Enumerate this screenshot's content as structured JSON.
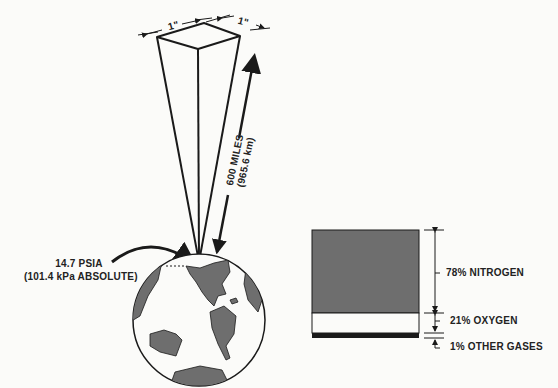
{
  "column": {
    "width_label_left": "1\"",
    "width_label_right": "1\"",
    "height_label": "600 MILES",
    "height_label_metric": "(965.6 km)"
  },
  "pressure": {
    "line1": "14.7 PSIA",
    "line2": "(101.4 kPa ABSOLUTE)"
  },
  "composition": {
    "items": [
      {
        "label": "78% NITROGEN",
        "percent": 78,
        "color": "#6e6e6e"
      },
      {
        "label": "21% OXYGEN",
        "percent": 21,
        "color": "#fbfbf9"
      },
      {
        "label": "1% OTHER GASES",
        "percent": 1,
        "color": "#1a1a1a"
      }
    ]
  },
  "colors": {
    "ink": "#1a1a1a",
    "land": "#6e6e6e",
    "paper": "#fbfbf9"
  }
}
